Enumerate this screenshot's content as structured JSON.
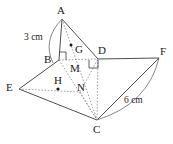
{
  "figure": {
    "stroke_color": "#3a3a3a",
    "dash_color": "#8a8a8a",
    "text_color": "#1a1a1a",
    "background": "#ffffff",
    "width": 173,
    "height": 144
  },
  "vertices": [
    {
      "id": "A",
      "label": "A",
      "x": 62,
      "y": 19,
      "label_x": 57,
      "label_y": 5
    },
    {
      "id": "B",
      "label": "B",
      "x": 59,
      "y": 60,
      "label_x": 44,
      "label_y": 54
    },
    {
      "id": "C",
      "label": "C",
      "x": 97,
      "y": 120,
      "label_x": 93,
      "label_y": 124
    },
    {
      "id": "D",
      "label": "D",
      "x": 98,
      "y": 59,
      "label_x": 98,
      "label_y": 45
    },
    {
      "id": "E",
      "label": "E",
      "x": 19,
      "y": 89,
      "label_x": 6,
      "label_y": 82
    },
    {
      "id": "F",
      "label": "F",
      "x": 159,
      "y": 58,
      "label_x": 160,
      "label_y": 46
    },
    {
      "id": "G",
      "label": "G",
      "x": 71,
      "y": 45,
      "label_x": 75,
      "label_y": 44
    },
    {
      "id": "H",
      "label": "H",
      "x": 58,
      "y": 89,
      "label_x": 54,
      "label_y": 75
    },
    {
      "id": "M",
      "label": "M",
      "x": 76,
      "y": 59,
      "label_x": 70,
      "label_y": 63
    },
    {
      "id": "N",
      "label": "N",
      "x": 80,
      "y": 92,
      "label_x": 77,
      "label_y": 82
    }
  ],
  "measurements": [
    {
      "id": "AB",
      "text": "3 cm",
      "x": 24,
      "y": 33
    },
    {
      "id": "CF",
      "text": "6 cm",
      "x": 124,
      "y": 96
    }
  ],
  "markers": {
    "centroid_dots": [
      "G",
      "H"
    ],
    "right_angles": [
      {
        "id": "angle-at-B",
        "at": "B"
      },
      {
        "id": "angle-at-D",
        "at": "D"
      }
    ]
  },
  "edges": [
    {
      "id": "A-B",
      "from": "A",
      "to": "B",
      "style": "solid"
    },
    {
      "id": "A-D",
      "from": "A",
      "to": "D",
      "style": "solid"
    },
    {
      "id": "A-C",
      "from": "A",
      "to": "C",
      "style": "dashed"
    },
    {
      "id": "B-D",
      "from": "B",
      "to": "D",
      "style": "dashed"
    },
    {
      "id": "B-E",
      "from": "B",
      "to": "E",
      "style": "solid"
    },
    {
      "id": "B-C",
      "from": "B",
      "to": "C",
      "style": "dashed"
    },
    {
      "id": "D-F",
      "from": "D",
      "to": "F",
      "style": "solid"
    },
    {
      "id": "D-C",
      "from": "D",
      "to": "C",
      "style": "dashed"
    },
    {
      "id": "E-C",
      "from": "E",
      "to": "C",
      "style": "solid"
    },
    {
      "id": "E-N",
      "from": "E",
      "to": "N",
      "style": "dashed"
    },
    {
      "id": "N-D",
      "from": "N",
      "to": "D",
      "style": "dashed"
    },
    {
      "id": "N-C",
      "from": "N",
      "to": "C",
      "style": "dashed"
    },
    {
      "id": "C-F",
      "from": "C",
      "to": "F",
      "style": "solid"
    }
  ],
  "arcs": [
    {
      "id": "arc-AB",
      "note": "arc spanning side AB"
    },
    {
      "id": "arc-CF",
      "note": "arc spanning side CF"
    }
  ]
}
